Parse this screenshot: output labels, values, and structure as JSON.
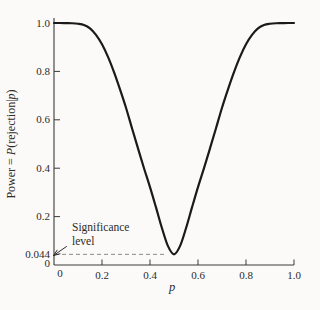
{
  "figure": {
    "background": "#fbfaf8",
    "curve_color": "#1a1a1a",
    "axis_color": "#3a3a3a",
    "dash_color": "#8a8a8a",
    "text_color": "#2b2b2b"
  },
  "axes": {
    "y_label_parts": {
      "pre": "Power = ",
      "P": "P",
      "mid": "(rejection|",
      "p": "p",
      "post": ")"
    },
    "x_label": "p",
    "origin_y_label": "0",
    "origin_x_label": "0"
  },
  "annotation": {
    "line1": "Significance",
    "line2": "level"
  },
  "chart_data": {
    "type": "line",
    "title": "",
    "xlabel": "p",
    "ylabel": "Power = P(rejection|p)",
    "xlim": [
      0,
      1.0
    ],
    "ylim": [
      0,
      1.0
    ],
    "grid": false,
    "legend": "none",
    "x_ticks": [
      0,
      0.2,
      0.4,
      0.6,
      0.8,
      1.0
    ],
    "x_tick_labels": [
      "0",
      "0.2",
      "0.4",
      "0.6",
      "0.8",
      "1.0"
    ],
    "y_ticks": [
      0,
      0.044,
      0.2,
      0.4,
      0.6,
      0.8,
      1.0
    ],
    "y_tick_labels": [
      "0",
      "0.044",
      "0.2",
      "0.4",
      "0.6",
      "0.8",
      "1.0"
    ],
    "significance_level": 0.044,
    "annotations": [
      {
        "text": "Significance level",
        "points_to_y": 0.044
      }
    ],
    "series": [
      {
        "name": "power-curve",
        "x": [
          0,
          0.025,
          0.05,
          0.075,
          0.1,
          0.125,
          0.15,
          0.175,
          0.2,
          0.225,
          0.25,
          0.275,
          0.3,
          0.325,
          0.35,
          0.375,
          0.4,
          0.425,
          0.45,
          0.475,
          0.5,
          0.525,
          0.55,
          0.575,
          0.6,
          0.625,
          0.65,
          0.675,
          0.7,
          0.725,
          0.75,
          0.775,
          0.8,
          0.825,
          0.85,
          0.875,
          0.9,
          0.925,
          0.95,
          0.975,
          1.0
        ],
        "y": [
          1.0,
          1.0,
          0.9995,
          0.999,
          0.997,
          0.992,
          0.978,
          0.951,
          0.912,
          0.86,
          0.797,
          0.726,
          0.65,
          0.565,
          0.482,
          0.4,
          0.322,
          0.238,
          0.152,
          0.078,
          0.044,
          0.078,
          0.152,
          0.238,
          0.322,
          0.4,
          0.482,
          0.565,
          0.65,
          0.726,
          0.797,
          0.86,
          0.912,
          0.951,
          0.978,
          0.992,
          0.997,
          0.999,
          0.9995,
          1.0,
          1.0
        ]
      }
    ]
  }
}
